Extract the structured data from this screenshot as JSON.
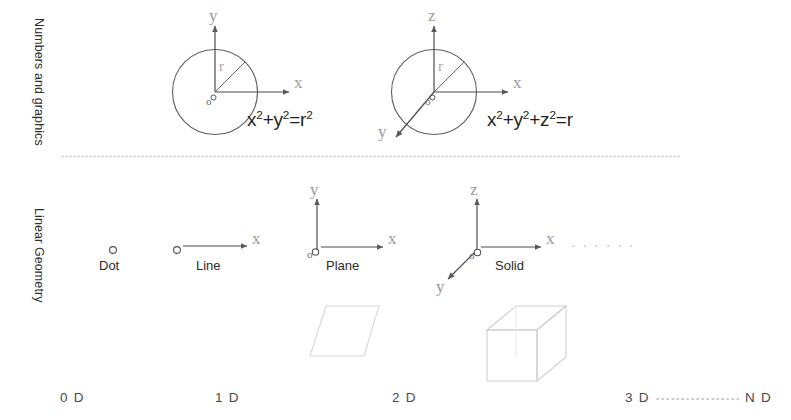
{
  "figure": {
    "background": "#ffffff",
    "ink_color": "#555555",
    "faint_color": "#d9d9d9",
    "axis_letter_color": "#9a9a9a"
  },
  "rows": [
    {
      "id": "numbers-and-graphics",
      "label": "Numbers and graphics"
    },
    {
      "id": "linear-geometry",
      "label": "Linear Geometry"
    }
  ],
  "separator": {
    "name": "dotted-row-separator",
    "style": "dotted"
  },
  "top_row": {
    "circle_2d": {
      "name": "circle-diagram-2d",
      "axes": [
        {
          "name": "y-axis",
          "label": "y"
        },
        {
          "name": "x-axis",
          "label": "x"
        }
      ],
      "origin_label": "o",
      "radius_label": "r",
      "equation": {
        "text": "x2+y2=r2",
        "parts": [
          {
            "base": "x",
            "sup": "2"
          },
          {
            "base": "+y",
            "sup": "2"
          },
          {
            "base": "=r",
            "sup": "2"
          }
        ]
      }
    },
    "sphere_3d": {
      "name": "sphere-diagram-3d",
      "axes": [
        {
          "name": "z-axis",
          "label": "z"
        },
        {
          "name": "x-axis",
          "label": "x"
        },
        {
          "name": "y-axis",
          "label": "y"
        }
      ],
      "origin_label": "o",
      "radius_label": "r",
      "equation": {
        "text": "x2+y2+z2=r",
        "parts": [
          {
            "base": "x",
            "sup": "2"
          },
          {
            "base": "+y",
            "sup": "2"
          },
          {
            "base": "+z",
            "sup": "2"
          },
          {
            "base": "=r",
            "sup": ""
          }
        ]
      }
    }
  },
  "bottom_row": {
    "items": [
      {
        "id": "dot",
        "caption": "Dot",
        "axes": [],
        "origin_marker": true,
        "shape": null
      },
      {
        "id": "line",
        "caption": "Line",
        "axes": [
          {
            "name": "x-axis",
            "label": "x"
          }
        ],
        "origin_marker": true,
        "shape": null
      },
      {
        "id": "plane",
        "caption": "Plane",
        "axes": [
          {
            "name": "y-axis",
            "label": "y"
          },
          {
            "name": "x-axis",
            "label": "x"
          }
        ],
        "origin_label": "o",
        "origin_marker": true,
        "shape": "parallelogram"
      },
      {
        "id": "solid",
        "caption": "Solid",
        "axes": [
          {
            "name": "z-axis",
            "label": "z"
          },
          {
            "name": "x-axis",
            "label": "x"
          },
          {
            "name": "y-axis",
            "label": "y"
          }
        ],
        "origin_label": "o",
        "origin_marker": true,
        "shape": "cube"
      }
    ],
    "continuation_dots": "· · · · · ·"
  },
  "scale": {
    "name": "dimension-scale",
    "labels": [
      "0 D",
      "1 D",
      "2 D",
      "3 D",
      "N D"
    ],
    "between_3d_and_nd": "················"
  }
}
